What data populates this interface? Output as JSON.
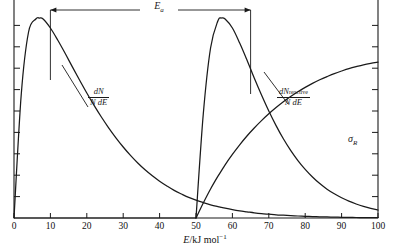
{
  "figure": {
    "name": "maxwell-boltzmann-reactive-distribution",
    "background": "#ffffff",
    "ink": "#1a1a1a"
  },
  "axes": {
    "x": {
      "label_italic": "E",
      "label_solidus": "/kJ mol",
      "label_exponent": "−1",
      "ticks": [
        0,
        10,
        20,
        30,
        40,
        50,
        60,
        70,
        80,
        90,
        100
      ],
      "tick_labels": [
        "0",
        "10",
        "20",
        "30",
        "40",
        "50",
        "60",
        "70",
        "80",
        "90",
        "100"
      ],
      "min": 0,
      "max": 100
    },
    "y": {
      "label": "",
      "tick_count": 9,
      "tick_labels": [],
      "min": 0,
      "max": 1
    }
  },
  "annotations": {
    "activation_energy": {
      "symbol": "E",
      "subscript": "a",
      "start_value": 10,
      "end_value": 65,
      "style": "double-headed-arrow"
    }
  },
  "curve_labels": {
    "distribution": {
      "numerator": "dN",
      "denominator": "N dE"
    },
    "reactive": {
      "numerator_main": "dN",
      "numerator_sub": "reactive",
      "denominator": "N dE"
    },
    "cross_section": {
      "symbol": "σ",
      "subscript": "R"
    }
  },
  "chart_data": {
    "type": "line",
    "title": "",
    "xlabel": "E/kJ mol⁻¹",
    "ylabel": "",
    "xlim": [
      0,
      100
    ],
    "ylim": [
      0,
      1
    ],
    "grid": false,
    "legend": "inline-curve-labels",
    "x": [
      0,
      2,
      4,
      6,
      7,
      8,
      10,
      12,
      14,
      16,
      18,
      20,
      22,
      24,
      26,
      28,
      30,
      32,
      34,
      36,
      38,
      40,
      42,
      44,
      46,
      48,
      50,
      52,
      54,
      56,
      57,
      58,
      60,
      62,
      64,
      66,
      68,
      70,
      72,
      74,
      76,
      78,
      80,
      82,
      84,
      86,
      88,
      90,
      92,
      94,
      96,
      98,
      100
    ],
    "series": [
      {
        "name": "dN/N dE",
        "label": "dN / N dE",
        "description": "Maxwell-Boltzmann distribution of molecular energies; peaks near E = 7 kJ mol⁻¹ and decays toward zero at high energy",
        "peak_x": 7,
        "peak_y": 1.0,
        "values": [
          0.0,
          0.62,
          0.93,
          0.995,
          1.0,
          0.995,
          0.95,
          0.89,
          0.825,
          0.757,
          0.69,
          0.625,
          0.563,
          0.505,
          0.451,
          0.401,
          0.355,
          0.313,
          0.275,
          0.241,
          0.211,
          0.184,
          0.16,
          0.138,
          0.12,
          0.103,
          0.089,
          0.077,
          0.066,
          0.057,
          0.053,
          0.049,
          0.042,
          0.036,
          0.031,
          0.026,
          0.022,
          0.019,
          0.016,
          0.014,
          0.012,
          0.01,
          0.0085,
          0.0072,
          0.0061,
          0.0051,
          0.0043,
          0.0036,
          0.003,
          0.0025,
          0.0021,
          0.0018,
          0.0015
        ]
      },
      {
        "name": "dN_reactive/N dE",
        "label": "dN reactive / N dE",
        "description": "Distribution of reactive collisions: zero below the activation energy, rises abruptly at E = 50, peaks near E = 57 and decays",
        "threshold_x": 50,
        "peak_x": 57,
        "peak_y": 1.0,
        "values": [
          0,
          0,
          0,
          0,
          0,
          0,
          0,
          0,
          0,
          0,
          0,
          0,
          0,
          0,
          0,
          0,
          0,
          0,
          0,
          0,
          0,
          0,
          0,
          0,
          0,
          0,
          0.0,
          0.52,
          0.85,
          0.985,
          1.0,
          0.995,
          0.95,
          0.875,
          0.79,
          0.7,
          0.615,
          0.535,
          0.462,
          0.396,
          0.338,
          0.287,
          0.243,
          0.205,
          0.172,
          0.144,
          0.121,
          0.101,
          0.084,
          0.07,
          0.058,
          0.048,
          0.04
        ]
      },
      {
        "name": "sigma_R",
        "label": "σR",
        "description": "Reaction cross section: zero below the threshold energy of 50 kJ mol⁻¹, then rising steadily with energy",
        "threshold_x": 50,
        "values": [
          0,
          0,
          0,
          0,
          0,
          0,
          0,
          0,
          0,
          0,
          0,
          0,
          0,
          0,
          0,
          0,
          0,
          0,
          0,
          0,
          0,
          0,
          0,
          0,
          0,
          0,
          0.0,
          0.075,
          0.145,
          0.208,
          0.237,
          0.266,
          0.318,
          0.366,
          0.41,
          0.45,
          0.487,
          0.521,
          0.552,
          0.581,
          0.607,
          0.631,
          0.653,
          0.673,
          0.691,
          0.707,
          0.722,
          0.735,
          0.747,
          0.757,
          0.766,
          0.773,
          0.779
        ]
      }
    ]
  }
}
